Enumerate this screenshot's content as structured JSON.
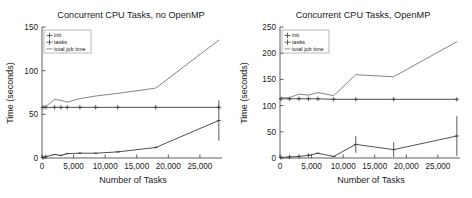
{
  "figure": {
    "background_color": "#ffffff",
    "panel_count": 2
  },
  "chart_data": [
    {
      "type": "line",
      "title": "Concurrent CPU Tasks, no OpenMP",
      "xlabel": "Number of Tasks",
      "ylabel": "Time (seconds)",
      "xlim": [
        0,
        28500
      ],
      "ylim": [
        0,
        150
      ],
      "xticks": [
        0,
        5000,
        10000,
        15000,
        20000,
        25000
      ],
      "xticklabels": [
        "0",
        "5,000",
        "10,000",
        "15,000",
        "20,000",
        "25,000"
      ],
      "yticks": [
        0,
        50,
        100,
        150
      ],
      "yticklabels": [
        "0",
        "50",
        "100",
        "150"
      ],
      "grid": false,
      "legend_position": "upper left",
      "legend_entries": [
        "init",
        "tasks",
        "total job time"
      ],
      "x": [
        150,
        600,
        2000,
        3000,
        4000,
        6000,
        8500,
        12000,
        18000,
        28000
      ],
      "series": [
        {
          "name": "init",
          "marker": "plus",
          "color": "#3c3c3c",
          "values": [
            58,
            58,
            58,
            58,
            58,
            58,
            58,
            58,
            58,
            58
          ],
          "errors": [
            0,
            0,
            0,
            0,
            0,
            0,
            0,
            0,
            0,
            0
          ]
        },
        {
          "name": "tasks",
          "marker": "plus",
          "color": "#3c3c3c",
          "values": [
            0.5,
            1.5,
            4,
            3,
            5,
            5.5,
            5.5,
            7,
            12,
            43
          ],
          "errors": [
            0,
            0,
            0.5,
            0.5,
            0.5,
            0.5,
            0.5,
            0.5,
            1,
            23
          ]
        },
        {
          "name": "total job time",
          "marker": "line",
          "color": "#6e6e6e",
          "values": [
            59,
            59,
            67,
            66,
            64,
            68,
            71,
            74,
            80,
            135
          ],
          "errors": [
            0,
            0,
            0,
            0,
            0,
            0,
            0,
            0,
            0,
            0
          ]
        }
      ]
    },
    {
      "type": "line",
      "title": "Concurrent CPU Tasks, OpenMP",
      "xlabel": "Number of Tasks",
      "ylabel": "Time (seconds)",
      "xlim": [
        0,
        28500
      ],
      "ylim": [
        0,
        250
      ],
      "xticks": [
        0,
        5000,
        10000,
        15000,
        20000,
        25000
      ],
      "xticklabels": [
        "0",
        "5,000",
        "10,000",
        "15,000",
        "20,000",
        "25,000"
      ],
      "yticks": [
        0,
        50,
        100,
        150,
        200,
        250
      ],
      "yticklabels": [
        "0",
        "50",
        "100",
        "150",
        "200",
        "250"
      ],
      "grid": false,
      "legend_position": "upper left",
      "legend_entries": [
        "init",
        "tasks",
        "total job time"
      ],
      "x": [
        150,
        1500,
        3000,
        4500,
        6000,
        8500,
        12000,
        18000,
        28000
      ],
      "series": [
        {
          "name": "init",
          "marker": "plus",
          "color": "#3c3c3c",
          "values": [
            113,
            113,
            113,
            113,
            113,
            112,
            112,
            112,
            112
          ],
          "errors": [
            0,
            0,
            0,
            0,
            0,
            0,
            0,
            0,
            0
          ]
        },
        {
          "name": "tasks",
          "marker": "plus",
          "color": "#3c3c3c",
          "values": [
            1,
            2,
            3,
            5,
            9,
            3,
            26,
            16,
            42
          ],
          "errors": [
            0,
            0,
            0,
            0,
            1,
            0.5,
            16,
            14,
            38
          ]
        },
        {
          "name": "total job time",
          "marker": "line",
          "color": "#6e6e6e",
          "values": [
            115,
            115,
            122,
            120,
            125,
            119,
            159,
            155,
            222
          ],
          "errors": [
            0,
            0,
            0,
            0,
            0,
            0,
            0,
            0,
            0
          ]
        }
      ]
    }
  ]
}
